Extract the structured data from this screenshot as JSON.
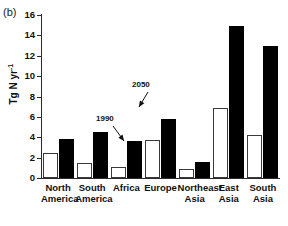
{
  "figure": {
    "panel_label": "(b)"
  },
  "chart_data": {
    "type": "bar",
    "title": "",
    "xlabel": "",
    "ylabel": "Tg N yr",
    "ylabel_exponent": "-1",
    "ylim": [
      0,
      16
    ],
    "yticks": [
      0,
      2,
      4,
      6,
      8,
      10,
      12,
      14,
      16
    ],
    "ytick_labels": [
      "0",
      "2",
      "4",
      "6",
      "8",
      "10",
      "12",
      "14",
      "16"
    ],
    "grid": false,
    "legend_position": "none",
    "categories": [
      "North America",
      "South America",
      "Africa",
      "Europe",
      "Northeast Asia",
      "East Asia",
      "South Asia"
    ],
    "category_lines": [
      [
        "North",
        "America"
      ],
      [
        "South",
        "America"
      ],
      [
        "Africa",
        ""
      ],
      [
        "Europe",
        ""
      ],
      [
        "Northeast",
        "Asia"
      ],
      [
        "East",
        "Asia"
      ],
      [
        "South",
        "Asia"
      ]
    ],
    "series": [
      {
        "name": "1990",
        "style": "open",
        "color": "#ffffff",
        "edge_color": "#3a3a3a",
        "values": [
          2.5,
          1.5,
          1.1,
          3.75,
          0.9,
          6.9,
          4.2
        ]
      },
      {
        "name": "2050",
        "style": "filled",
        "color": "#000000",
        "edge_color": "#000000",
        "values": [
          3.8,
          4.55,
          3.6,
          5.8,
          1.6,
          14.9,
          12.95
        ]
      }
    ],
    "annotations": [
      {
        "text": "1990",
        "target_series": "1990",
        "target_category": "Europe"
      },
      {
        "text": "2050",
        "target_series": "2050",
        "target_category": "Europe"
      }
    ]
  }
}
